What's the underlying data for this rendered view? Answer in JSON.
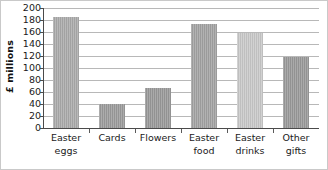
{
  "chart_data": {
    "type": "bar",
    "title": "",
    "xlabel": "",
    "ylabel": "£ millions",
    "ylim": [
      0,
      200
    ],
    "yticks": [
      0,
      20,
      40,
      60,
      80,
      100,
      120,
      140,
      160,
      180,
      200
    ],
    "grid": true,
    "legend": "none",
    "categories": [
      "Easter eggs",
      "Cards",
      "Flowers",
      "Easter food",
      "Easter drinks",
      "Other gifts"
    ],
    "category_lines": [
      {
        "line1": "Easter",
        "line2": "eggs"
      },
      {
        "line1": "Cards",
        "line2": ""
      },
      {
        "line1": "Flowers",
        "line2": ""
      },
      {
        "line1": "Easter",
        "line2": "food"
      },
      {
        "line1": "Easter",
        "line2": "drinks"
      },
      {
        "line1": "Other",
        "line2": "gifts"
      }
    ],
    "values": [
      185,
      40,
      67,
      173,
      158,
      118
    ],
    "bar_colors": [
      "#ababab",
      "#9c9c9c",
      "#9a9a9a",
      "#a3a3a3",
      "#c9c9c9",
      "#9a9a9a"
    ]
  },
  "axis": {
    "y_title": "£ millions",
    "tick_labels": [
      "200",
      "180",
      "160",
      "140",
      "120",
      "100",
      "80",
      "60",
      "40",
      "20",
      "0"
    ]
  },
  "colors": {
    "gridline": "#b8b8b8",
    "axis": "#4a4a4a",
    "text": "#1a1a1a",
    "border": "#c9c9c9",
    "background": "#ffffff"
  }
}
